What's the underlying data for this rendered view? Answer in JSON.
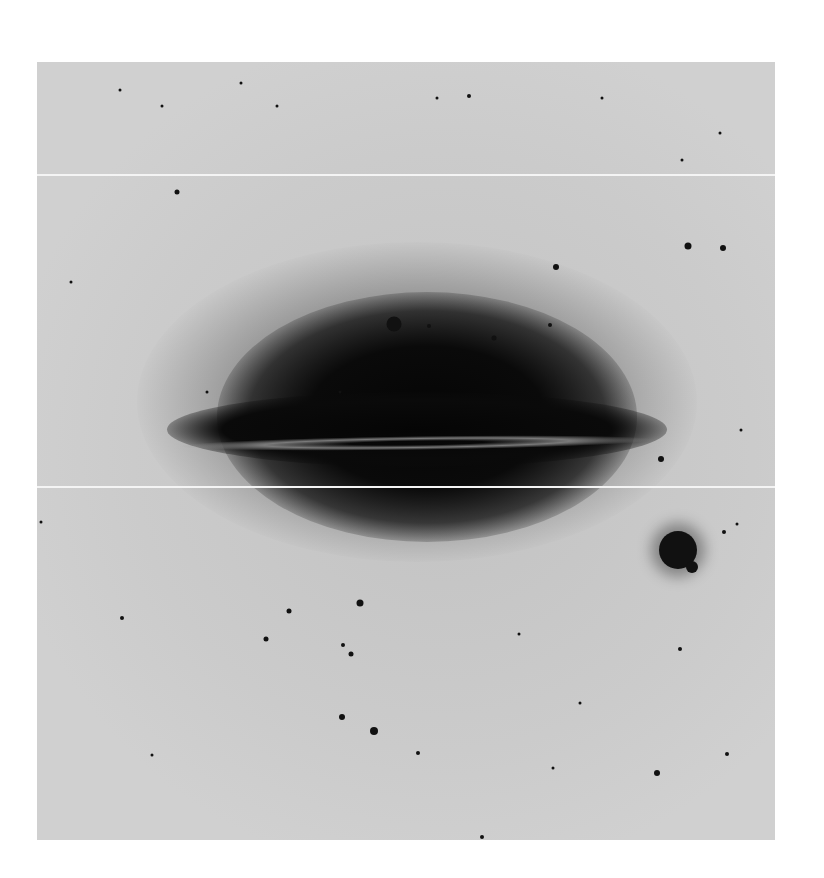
{
  "image": {
    "description": "Photographic negative of an edge-on spiral galaxy with dust lane, surrounded by field stars",
    "colors": {
      "background": "#ffffff",
      "sky": "#c9c9c9",
      "galaxy": "#0a0a0a",
      "dust_lane": "#8a8a8a",
      "scan_line": "#f4f4f4"
    },
    "scan_lines_y": [
      112,
      424
    ],
    "stars": [
      [
        83,
        28,
        3
      ],
      [
        204,
        21,
        3
      ],
      [
        125,
        44,
        3
      ],
      [
        240,
        44,
        3
      ],
      [
        400,
        36,
        3
      ],
      [
        432,
        34,
        4
      ],
      [
        565,
        36,
        3
      ],
      [
        683,
        71,
        3
      ],
      [
        645,
        98,
        3
      ],
      [
        140,
        130,
        5
      ],
      [
        651,
        184,
        7
      ],
      [
        686,
        186,
        6
      ],
      [
        519,
        205,
        6
      ],
      [
        34,
        220,
        3
      ],
      [
        357,
        262,
        15
      ],
      [
        392,
        264,
        4
      ],
      [
        457,
        276,
        5
      ],
      [
        513,
        263,
        4
      ],
      [
        170,
        330,
        3
      ],
      [
        303,
        330,
        3
      ],
      [
        624,
        397,
        6
      ],
      [
        704,
        368,
        3
      ],
      [
        4,
        460,
        3
      ],
      [
        641,
        488,
        38
      ],
      [
        655,
        505,
        12
      ],
      [
        687,
        470,
        4
      ],
      [
        700,
        462,
        3
      ],
      [
        252,
        549,
        5
      ],
      [
        323,
        541,
        7
      ],
      [
        85,
        556,
        4
      ],
      [
        229,
        577,
        5
      ],
      [
        306,
        583,
        4
      ],
      [
        314,
        592,
        5
      ],
      [
        643,
        587,
        4
      ],
      [
        482,
        572,
        3
      ],
      [
        337,
        669,
        8
      ],
      [
        305,
        655,
        6
      ],
      [
        381,
        691,
        4
      ],
      [
        115,
        693,
        3
      ],
      [
        690,
        692,
        4
      ],
      [
        620,
        711,
        6
      ],
      [
        516,
        706,
        3
      ],
      [
        543,
        641,
        3
      ],
      [
        445,
        775,
        4
      ]
    ]
  }
}
